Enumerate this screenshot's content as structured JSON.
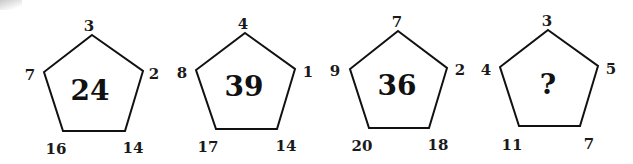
{
  "puzzle": {
    "pentagons": [
      {
        "center": "24",
        "top": "3",
        "left": "7",
        "right": "2",
        "bottom_left": "16",
        "bottom_right": "14"
      },
      {
        "center": "39",
        "top": "4",
        "left": "8",
        "right": "1",
        "bottom_left": "17",
        "bottom_right": "14"
      },
      {
        "center": "36",
        "top": "7",
        "left": "9",
        "right": "2",
        "bottom_left": "20",
        "bottom_right": "18"
      },
      {
        "center": "?",
        "top": "3",
        "left": "4",
        "right": "5",
        "bottom_left": "11",
        "bottom_right": "7"
      }
    ]
  }
}
